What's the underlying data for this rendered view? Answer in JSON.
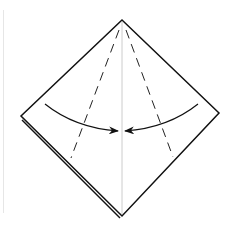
{
  "diagram": {
    "type": "origami-step",
    "colors": {
      "outline": "#111111",
      "crease": "#cccccc",
      "valley_fold": "#222222",
      "arrow": "#111111",
      "background": "#ffffff",
      "frame": "#e6e6e6"
    },
    "shape": {
      "top": [
        122,
        20
      ],
      "right": [
        219,
        113
      ],
      "bottom": [
        122,
        216
      ],
      "left": [
        21,
        116
      ]
    },
    "folds": [
      {
        "kind": "valley",
        "from": [
          119,
          30
        ],
        "to": [
          71,
          158
        ]
      },
      {
        "kind": "valley",
        "from": [
          126,
          30
        ],
        "to": [
          173,
          157
        ]
      }
    ],
    "arrows": [
      {
        "direction": "right",
        "from": [
          45,
          104
        ],
        "to": [
          118,
          131
        ]
      },
      {
        "direction": "left",
        "from": [
          198,
          104
        ],
        "to": [
          125,
          131
        ]
      }
    ]
  }
}
